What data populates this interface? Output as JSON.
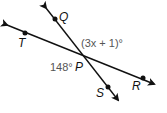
{
  "diagram": {
    "points": {
      "Q": "Q",
      "T": "T",
      "P": "P",
      "S": "S",
      "R": "R"
    },
    "angles": {
      "upper_right": "(3x + 1)°",
      "lower_left": "148°"
    },
    "colors": {
      "line": "#111111",
      "angle_label": "#555555"
    }
  }
}
